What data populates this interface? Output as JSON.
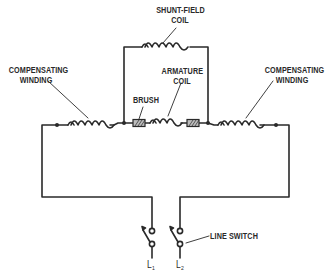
{
  "diagram": {
    "type": "circuit-schematic",
    "colors": {
      "line": "#2a2a2a",
      "brush_fill": "#bdbdbd",
      "background": "#ffffff"
    },
    "labels": {
      "shunt_field_coil": [
        "SHUNT-FIELD",
        "COIL"
      ],
      "compensating_winding_left": [
        "COMPENSATING",
        "WINDING"
      ],
      "compensating_winding_right": [
        "COMPENSATING",
        "WINDING"
      ],
      "brush": "BRUSH",
      "armature_coil": [
        "ARMATURE",
        "COIL"
      ],
      "line_switch": "LINE SWITCH",
      "terminal_1": {
        "letter": "L",
        "sub": "1"
      },
      "terminal_2": {
        "letter": "L",
        "sub": "2"
      }
    },
    "components": [
      {
        "id": "shunt-field-coil",
        "kind": "inductor",
        "turns": 6
      },
      {
        "id": "compensating-winding-left",
        "kind": "inductor",
        "turns": 5
      },
      {
        "id": "compensating-winding-right",
        "kind": "inductor",
        "turns": 5
      },
      {
        "id": "armature-coil",
        "kind": "inductor",
        "turns": 3
      },
      {
        "id": "brush-left",
        "kind": "brush"
      },
      {
        "id": "brush-right",
        "kind": "brush"
      },
      {
        "id": "line-switch-l1",
        "kind": "switch"
      },
      {
        "id": "line-switch-l2",
        "kind": "switch"
      }
    ]
  }
}
